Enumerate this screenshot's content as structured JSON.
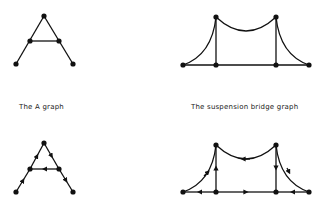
{
  "captions": {
    "a_graph": "The A graph",
    "bridge_graph": "The suspension bridge graph"
  },
  "colors": {
    "ink": "#111111",
    "background": "#ffffff"
  },
  "figures": [
    {
      "name": "a-graph",
      "directed": false
    },
    {
      "name": "suspension-bridge-graph",
      "directed": false
    },
    {
      "name": "a-graph-directed",
      "directed": true
    },
    {
      "name": "suspension-bridge-graph-directed",
      "directed": true
    }
  ]
}
